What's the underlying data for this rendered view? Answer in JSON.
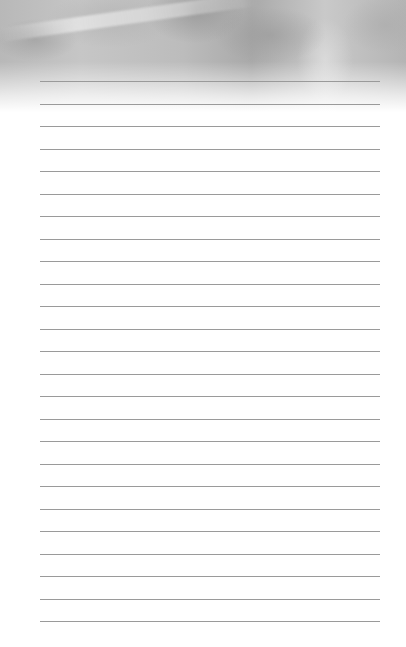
{
  "page": {
    "type": "lined-notepad",
    "header": {
      "style": "grayscale-photo-texture-fading-to-white"
    },
    "ruled_lines": {
      "count": 25,
      "first_y": 81,
      "spacing": 22.5,
      "left": 40,
      "right": 380,
      "color": "#9a9a9a"
    },
    "background_color": "#ffffff"
  }
}
